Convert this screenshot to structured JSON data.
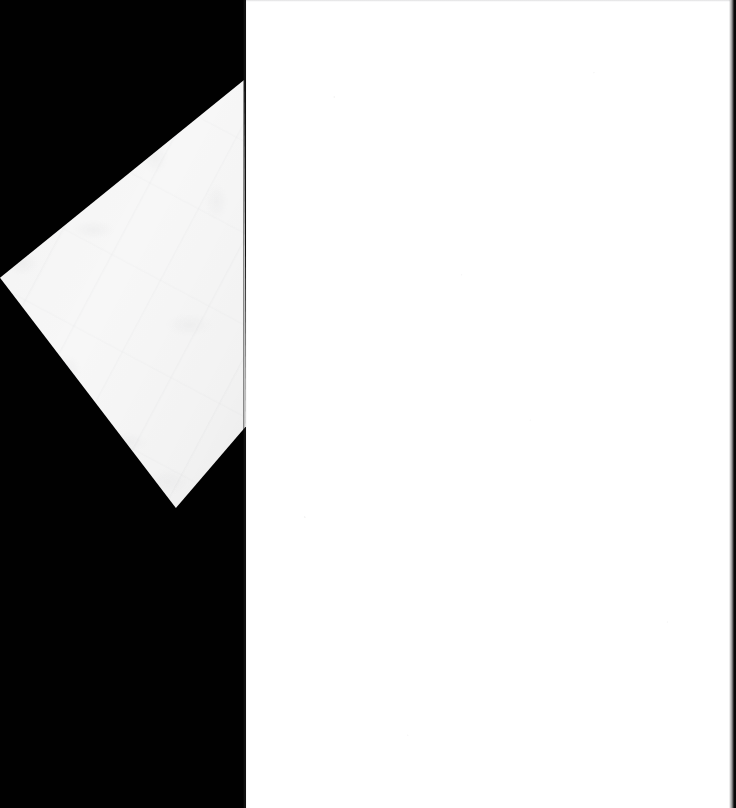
{
  "image": {
    "title": "Scanned page corner on dark background",
    "width": 736,
    "height": 808,
    "caption": ""
  },
  "regions": {
    "backdrop": {
      "name": "scanner-backdrop",
      "label": "",
      "color": "#010101",
      "x": 0,
      "y": 0,
      "width": 246,
      "height": 808
    },
    "page_field": {
      "name": "blank-page-field",
      "label": "",
      "color": "#ffffff",
      "x": 246,
      "y": 0,
      "width": 490,
      "height": 808
    },
    "paper_corner": {
      "name": "lifted-paper-corner",
      "label": "",
      "color": "#f7f7f7",
      "vertices": [
        [
          244,
          80
        ],
        [
          246,
          426
        ],
        [
          176,
          508
        ],
        [
          0,
          278
        ]
      ]
    },
    "right_edge_strip": {
      "name": "right-edge-shadow-strip",
      "label": "",
      "color": "#0b0b0c",
      "x": 729,
      "y": 0,
      "width": 7,
      "height": 808
    },
    "top_hairline": {
      "name": "top-scan-hairline",
      "label": "",
      "color": "#8c8c91",
      "x": 246,
      "y": 0,
      "width": 484,
      "height": 2
    },
    "backdrop_seam": {
      "name": "backdrop-page-seam",
      "label": "",
      "color": "#787878",
      "x": 243,
      "y": 0,
      "width": 4,
      "height": 808
    }
  },
  "colors": {
    "backdrop_black": "#010101",
    "page_white": "#ffffff",
    "paper_white": "#f7f7f7",
    "paper_shadow": "#e9e9ea",
    "seam_gray": "#8c8c91",
    "edge_strip": "#0b0b0c"
  }
}
